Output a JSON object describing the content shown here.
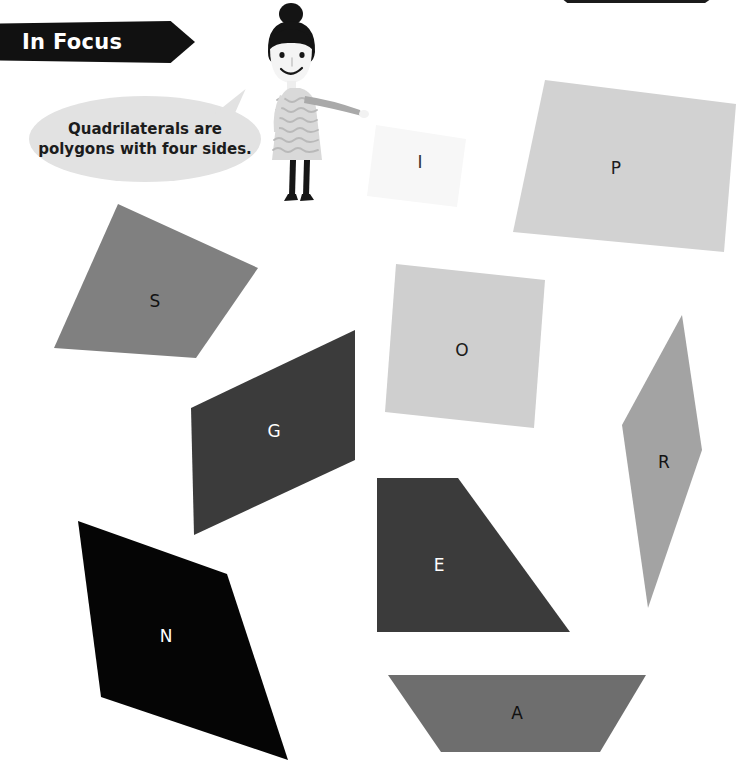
{
  "page": {
    "background_color": "#ffffff",
    "width": 736,
    "height": 770
  },
  "banner": {
    "label": "In Focus",
    "background_color": "#111111",
    "text_color": "#ffffff"
  },
  "speech_bubble": {
    "line1": "Quadrilaterals are",
    "line2": "polygons with four sides.",
    "background_color": "#e2e2e2",
    "text_color": "#1c1c1c"
  },
  "character": {
    "name": "girl-pointing",
    "hair_color": "#111111",
    "dress_color": "#d8d8d8",
    "skin_color": "#f2f2f2"
  },
  "shapes": [
    {
      "letter": "I",
      "kind": "quadrilateral",
      "fill": "#f7f7f7",
      "label_color": "#333333",
      "points": "376,125 466,139 457,207 367,196",
      "label_x": 420,
      "label_y": 163
    },
    {
      "letter": "P",
      "kind": "rectangle",
      "fill": "#d2d2d2",
      "label_color": "#1c1c1c",
      "points": "545,80 736,104 724,252 513,232",
      "label_x": 616,
      "label_y": 169
    },
    {
      "letter": "S",
      "kind": "square",
      "fill": "#808080",
      "label_color": "#121212",
      "points": "118,204 258,268 196,358 54,348",
      "label_x": 155,
      "label_y": 302
    },
    {
      "letter": "O",
      "kind": "square",
      "fill": "#cfcfcf",
      "label_color": "#1c1c1c",
      "points": "396,264 545,280 534,428 385,412",
      "label_x": 462,
      "label_y": 351
    },
    {
      "letter": "G",
      "kind": "parallelogram",
      "fill": "#3b3b3b",
      "label_color": "#ffffff",
      "points": "355,330 355,460 194,535 191,408",
      "label_x": 274,
      "label_y": 432
    },
    {
      "letter": "R",
      "kind": "kite",
      "fill": "#a3a3a3",
      "label_color": "#121212",
      "points": "682,315 702,450 648,608 622,425",
      "label_x": 664,
      "label_y": 463
    },
    {
      "letter": "E",
      "kind": "trapezoid",
      "fill": "#3b3b3b",
      "label_color": "#ffffff",
      "points": "377,478 458,478 570,632 377,632",
      "label_x": 439,
      "label_y": 566
    },
    {
      "letter": "N",
      "kind": "quadrilateral",
      "fill": "#050505",
      "label_color": "#ffffff",
      "points": "78,521 227,574 288,760 101,697",
      "label_x": 166,
      "label_y": 637
    },
    {
      "letter": "A",
      "kind": "trapezoid",
      "fill": "#6e6e6e",
      "label_color": "#111111",
      "points": "388,675 646,675 600,752 441,752",
      "label_x": 517,
      "label_y": 714
    }
  ]
}
